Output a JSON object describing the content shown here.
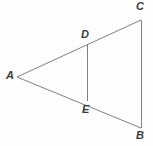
{
  "figure": {
    "kind": "geometry-diagram",
    "width": 153,
    "height": 146,
    "background_color": "#fefefe",
    "stroke_color": "#808080",
    "label_color": "#3a3a3a",
    "stroke_width": 1
  },
  "points": {
    "A": {
      "label": "A",
      "x": 17,
      "y": 77
    },
    "B": {
      "label": "B",
      "x": 141,
      "y": 128
    },
    "C": {
      "label": "C",
      "x": 141,
      "y": 20
    },
    "D": {
      "label": "D",
      "x": 87,
      "y": 44
    },
    "E": {
      "label": "E",
      "x": 87,
      "y": 101
    }
  },
  "segments": [
    {
      "name": "A-C",
      "from": "A",
      "to": "C"
    },
    {
      "name": "A-B",
      "from": "A",
      "to": "B"
    },
    {
      "name": "C-B",
      "from": "C",
      "to": "B"
    },
    {
      "name": "D-E",
      "from": "D",
      "to": "E"
    }
  ]
}
